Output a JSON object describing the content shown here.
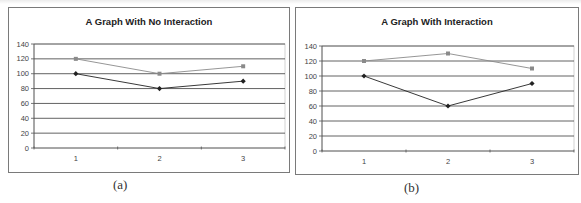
{
  "chart_data": [
    {
      "type": "line",
      "title": "A Graph With No Interaction",
      "caption": "(a)",
      "categories": [
        "1",
        "2",
        "3"
      ],
      "series": [
        {
          "name": "Series 1 (gray squares)",
          "marker": "square",
          "color": "#8a8a8a",
          "values": [
            120,
            100,
            110
          ]
        },
        {
          "name": "Series 2 (dark diamonds)",
          "marker": "diamond",
          "color": "#222222",
          "values": [
            100,
            80,
            90
          ]
        }
      ],
      "xlabel": "",
      "ylabel": "",
      "ylim": [
        0,
        140
      ],
      "yticks": [
        0,
        20,
        40,
        60,
        80,
        100,
        120,
        140
      ],
      "grid": true,
      "legend": "none"
    },
    {
      "type": "line",
      "title": "A Graph With Interaction",
      "caption": "(b)",
      "categories": [
        "1",
        "2",
        "3"
      ],
      "series": [
        {
          "name": "Series 1 (gray squares)",
          "marker": "square",
          "color": "#8a8a8a",
          "values": [
            120,
            130,
            110
          ]
        },
        {
          "name": "Series 2 (dark diamonds)",
          "marker": "diamond",
          "color": "#222222",
          "values": [
            100,
            60,
            90
          ]
        }
      ],
      "xlabel": "",
      "ylabel": "",
      "ylim": [
        0,
        140
      ],
      "yticks": [
        0,
        20,
        40,
        60,
        80,
        100,
        120,
        140
      ],
      "grid": true,
      "legend": "none"
    }
  ],
  "figures": {
    "left": {
      "title": "A Graph With No Interaction",
      "caption": "(a)"
    },
    "right": {
      "title": "A Graph With Interaction",
      "caption": "(b)"
    }
  },
  "colors": {
    "gridline": "#3a3a3a",
    "frame": "#7a7a7a",
    "series_light": "#8a8a8a",
    "series_dark": "#222222"
  }
}
